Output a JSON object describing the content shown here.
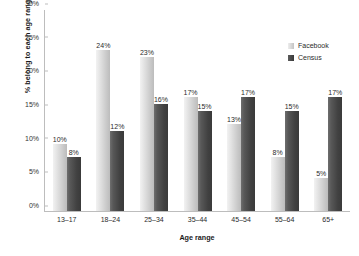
{
  "chart_data": {
    "type": "bar",
    "title": "",
    "xlabel": "Age range",
    "ylabel": "% belong to each age range",
    "categories": [
      "13–17",
      "18–24",
      "25–34",
      "35–44",
      "45–54",
      "55–64",
      "65+"
    ],
    "series": [
      {
        "name": "Facebook",
        "color": "#d0d0d0",
        "values": [
          10,
          24,
          23,
          17,
          13,
          8,
          5
        ],
        "labels": [
          "10%",
          "24%",
          "23%",
          "17%",
          "13%",
          "8%",
          "5%"
        ]
      },
      {
        "name": "Census",
        "color": "#404040",
        "values": [
          8,
          12,
          16,
          15,
          17,
          15,
          17
        ],
        "labels": [
          "8%",
          "12%",
          "16%",
          "15%",
          "17%",
          "15%",
          "17%"
        ]
      }
    ],
    "ylim": [
      0,
      30
    ],
    "yticks": [
      0,
      5,
      10,
      15,
      20,
      25,
      30
    ],
    "ytick_labels": [
      "0%",
      "5%",
      "10%",
      "15%",
      "20%",
      "25%",
      "30%"
    ],
    "grid": false,
    "legend_position": "top-right"
  }
}
